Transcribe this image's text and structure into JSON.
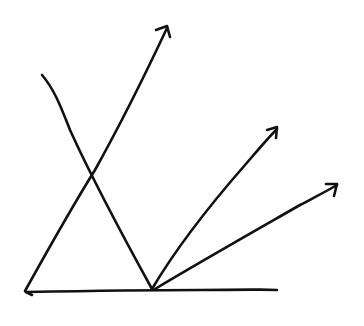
{
  "diagram": {
    "stroke_color": "#111111",
    "background": "#ffffff",
    "baseline": {
      "from": [
        25,
        292
      ],
      "to": [
        277,
        290
      ]
    },
    "lines": [
      {
        "name": "long-arrow",
        "from": [
          25,
          292
        ],
        "to": [
          167,
          27
        ],
        "arrow": true
      },
      {
        "name": "incident-line",
        "from": [
          42,
          75
        ],
        "to": [
          152,
          289
        ],
        "arrow": false
      },
      {
        "name": "middle-arrow",
        "from": [
          152,
          289
        ],
        "to": [
          277,
          128
        ],
        "arrow": true
      },
      {
        "name": "low-arrow",
        "from": [
          155,
          289
        ],
        "to": [
          337,
          185
        ],
        "arrow": true
      }
    ]
  }
}
